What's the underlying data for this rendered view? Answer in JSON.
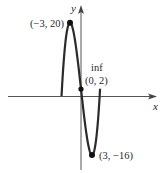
{
  "chart_data": {
    "type": "line",
    "title": "",
    "xlabel": "x",
    "ylabel": "y",
    "function": "f(x) = x^3/3 - 9x + 2",
    "xlim": [
      -5.3,
      5.2
    ],
    "grid": false,
    "legend": null,
    "series": [
      {
        "name": "f(x)",
        "x": [
          -5.3,
          -5,
          -4.5,
          -4,
          -3.5,
          -3,
          -2.5,
          -2,
          -1.5,
          -1,
          -0.5,
          0,
          0.5,
          1,
          1.5,
          2,
          2.5,
          3,
          3.5,
          4,
          4.5,
          5,
          5.2
        ],
        "y": [
          -0.93,
          4.33,
          9.13,
          16.67,
          19.21,
          20,
          19.29,
          17.33,
          14.38,
          10.67,
          6.46,
          2,
          -2.46,
          -6.67,
          -10.38,
          -13.33,
          -15.29,
          -16,
          -15.21,
          -12.67,
          -8.13,
          -1.33,
          1.08
        ]
      }
    ],
    "points": [
      {
        "name": "local-max",
        "x": -3,
        "y": 20,
        "label": "(−3, 20)"
      },
      {
        "name": "inflection",
        "x": 0,
        "y": 2,
        "label": "(0, 2)",
        "annotation": "inf"
      },
      {
        "name": "local-min",
        "x": 3,
        "y": -16,
        "label": "(3, −16)"
      }
    ]
  },
  "labels": {
    "x_axis": "x",
    "y_axis": "y",
    "max_point": "(−3, 20)",
    "inflection_note": "inf",
    "inflection_point": "(0, 2)",
    "min_point": "(3, −16)"
  },
  "colors": {
    "curve": "#2b2b2b",
    "axis": "#555555",
    "text": "#2a2a2a"
  }
}
